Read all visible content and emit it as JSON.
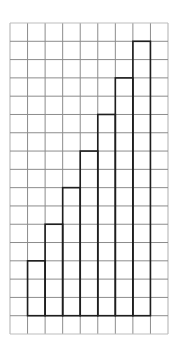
{
  "diagram": {
    "type": "grid-staircase",
    "grid": {
      "columns": 9,
      "rows": 17,
      "line_color": "#8c8c8c",
      "border_color": "#bdbdbd"
    },
    "staircase": {
      "outline_color": "#1e1e1e",
      "baseline_row": 16,
      "start_column": 1,
      "bar_heights_in_cells": [
        3,
        5,
        7,
        9,
        11,
        13,
        15
      ]
    }
  },
  "chart_data": {
    "type": "bar",
    "categories": [
      "1",
      "2",
      "3",
      "4",
      "5",
      "6",
      "7"
    ],
    "values": [
      3,
      5,
      7,
      9,
      11,
      13,
      15
    ],
    "title": "",
    "xlabel": "",
    "ylabel": "",
    "ylim": [
      0,
      16
    ],
    "grid": true,
    "legend": "none"
  }
}
